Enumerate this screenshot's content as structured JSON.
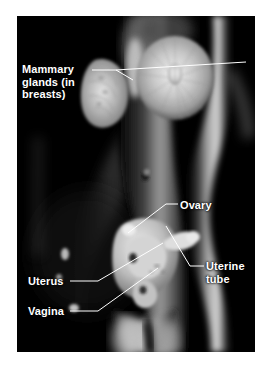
{
  "figure": {
    "frame_color": "#ffffff",
    "plate_color": "#000000",
    "label_color": "#ffffff",
    "leader_color": "#ffffff"
  },
  "labels": {
    "mammary": "Mammary\nglands (in\nbreasts)",
    "ovary": "Ovary",
    "uterine_tube": "Uterine\ntube",
    "uterus": "Uterus",
    "vagina": "Vagina"
  },
  "structures": [
    {
      "name": "mammary-gland-lateral",
      "label": "Mammary glands (in breasts)"
    },
    {
      "name": "mammary-gland-frontal",
      "label": "Mammary glands (in breasts)"
    },
    {
      "name": "ovary",
      "label": "Ovary"
    },
    {
      "name": "uterine-tube",
      "label": "Uterine tube"
    },
    {
      "name": "uterus",
      "label": "Uterus"
    },
    {
      "name": "vagina",
      "label": "Vagina"
    }
  ]
}
